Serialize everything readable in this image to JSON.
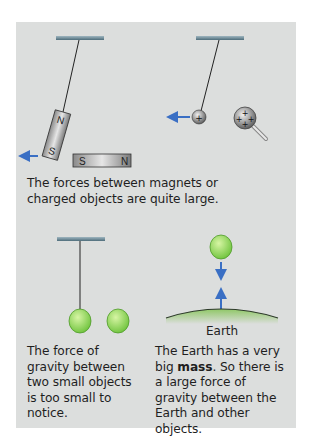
{
  "figure": {
    "panel_top": {
      "caption": "The forces between magnets or charged objects are quite large.",
      "magnet_hanging": {
        "pole_top": "N",
        "pole_bottom": "S"
      },
      "magnet_fixed": {
        "pole_left": "S",
        "pole_right": "N"
      },
      "charge_symbol": "+"
    },
    "panel_bottom_left": {
      "caption": "The force of gravity between two small objects is too small to notice."
    },
    "panel_bottom_right": {
      "caption_pre": "The Earth has a very big ",
      "caption_bold": "mass",
      "caption_post": ". So there is a large force of gravity between the Earth and other objects.",
      "earth_label": "Earth"
    },
    "colors": {
      "background": "#dcdedd",
      "arrow": "#3a6fc4",
      "apple": "#8fd14f",
      "ground": "#8fc766",
      "bar": "#6b8a99"
    }
  }
}
